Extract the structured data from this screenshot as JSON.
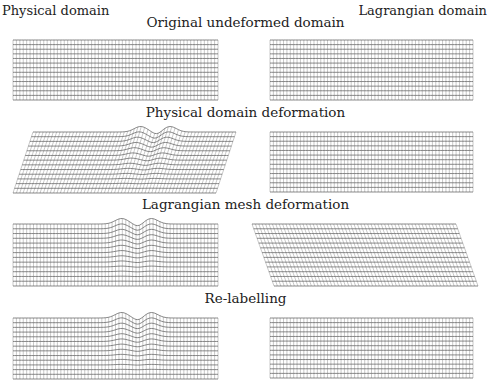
{
  "header": {
    "left_label": "Physical domain",
    "right_label": "Lagrangian domain"
  },
  "colors": {
    "vertical_line": "#9a9a9a",
    "horizontal_line": "#555555",
    "text": "#222222"
  },
  "mesh": {
    "columns": 60,
    "rows": 13
  },
  "rows": [
    {
      "title": "Original undeformed domain",
      "title_y": 22,
      "left": {
        "type": "rect",
        "x0": 13,
        "x1": 218,
        "y0": 40,
        "y1": 100
      },
      "right": {
        "type": "rect",
        "x0": 270,
        "x1": 473,
        "y0": 40,
        "y1": 100
      }
    },
    {
      "title": "Physical domain deformation",
      "title_y": 112,
      "left": {
        "type": "skew-bump",
        "x0": 33,
        "x1": 236,
        "y0": 132,
        "y1": 193,
        "shift_bottom": -20,
        "bump": true
      },
      "right": {
        "type": "rect",
        "x0": 270,
        "x1": 473,
        "y0": 132,
        "y1": 192
      }
    },
    {
      "title": "Lagrangian mesh deformation",
      "title_y": 204,
      "left": {
        "type": "bump",
        "x0": 13,
        "x1": 218,
        "y0": 224,
        "y1": 286,
        "bump": true
      },
      "right": {
        "type": "skew",
        "x0": 252,
        "x1": 456,
        "y0": 224,
        "y1": 286,
        "shift_bottom": 22
      }
    },
    {
      "title": "Re-labelling",
      "title_y": 298,
      "left": {
        "type": "bump",
        "x0": 13,
        "x1": 218,
        "y0": 318,
        "y1": 379,
        "bump": true
      },
      "right": {
        "type": "rect",
        "x0": 270,
        "x1": 473,
        "y0": 318,
        "y1": 378
      }
    }
  ]
}
